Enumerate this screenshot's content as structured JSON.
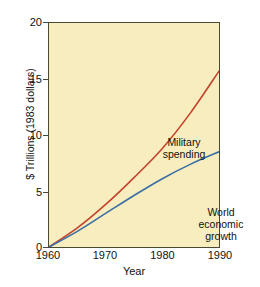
{
  "chart_data": {
    "type": "line",
    "title": "",
    "xlabel": "Year",
    "ylabel": "$ Trillions (1983 dollars)",
    "xlim": [
      1960,
      1990
    ],
    "ylim": [
      0,
      20
    ],
    "xticks": [
      "1960",
      "1970",
      "1980",
      "1990"
    ],
    "yticks": [
      "0",
      "5",
      "10",
      "15",
      "20"
    ],
    "grid": false,
    "legend_position": "inline-annotations",
    "background_color": "#f7edbe",
    "frame_color": "#4a4a32",
    "series": [
      {
        "name": "Military spending",
        "color": "#c4432c",
        "annotation": "Military\nspending",
        "x": [
          1960,
          1965,
          1970,
          1975,
          1980,
          1985,
          1990
        ],
        "values": [
          0,
          1.7,
          3.8,
          6.2,
          8.8,
          12.0,
          15.7
        ]
      },
      {
        "name": "World economic growth",
        "color": "#3a6ea5",
        "annotation": "World\neconomic\ngrowth",
        "x": [
          1960,
          1965,
          1970,
          1975,
          1980,
          1985,
          1990
        ],
        "values": [
          0,
          1.4,
          3.0,
          4.6,
          6.1,
          7.4,
          8.5
        ]
      }
    ]
  },
  "axes": {
    "y_title": "$ Trillions (1983 dollars)",
    "x_title": "Year",
    "y_tick_labels": [
      "20",
      "15",
      "10",
      "5",
      "0"
    ],
    "x_tick_labels": [
      "1960",
      "1970",
      "1980",
      "1990"
    ]
  },
  "annotations": {
    "military": "Military\nspending",
    "world": "World\neconomic\ngrowth"
  }
}
